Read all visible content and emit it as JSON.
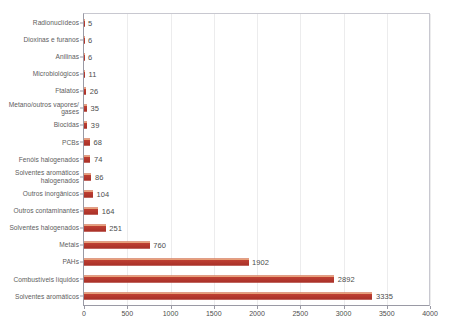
{
  "chart_data": {
    "type": "bar",
    "orientation": "horizontal",
    "title": "",
    "subtitle": "",
    "xlabel": "",
    "ylabel": "",
    "xlim": [
      0,
      4000
    ],
    "xticks": [
      0,
      500,
      1000,
      1500,
      2000,
      2500,
      3000,
      3500,
      4000
    ],
    "grid": "vertical",
    "legend": "none",
    "bar_color": "#b23a31",
    "bar_highlight_color": "#e8a07a",
    "gridline_color": "#ececed",
    "axis_color": "#9a9aa5",
    "text_color": "#5d5d5d",
    "categories": [
      "Radionuclídeos",
      "Dioxinas e furanos",
      "Anilinas",
      "Microbiológicos",
      "Ftalatos",
      "Metano/outros vapores/ gases",
      "Biocidas",
      "PCBs",
      "Fenóis halogenados",
      "Solventes aromáticos halogenados",
      "Outros inorgânicos",
      "Outros contaminantes",
      "Solventes halogenados",
      "Metais",
      "PAHs",
      "Combustíveis líquidos",
      "Solventes aromáticos"
    ],
    "values": [
      5,
      6,
      6,
      11,
      26,
      35,
      39,
      68,
      74,
      86,
      104,
      164,
      251,
      760,
      1902,
      2892,
      3335
    ],
    "value_labels": [
      "5",
      "6",
      "6",
      "11",
      "26",
      "35",
      "39",
      "68",
      "74",
      "86",
      "104",
      "164",
      "251",
      "760",
      "1902",
      "2892",
      "3335"
    ]
  }
}
